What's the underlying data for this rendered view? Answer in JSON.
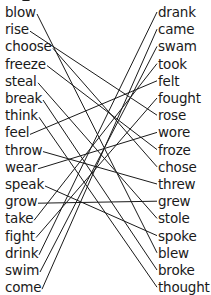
{
  "left_words": [
    "blow",
    "rise",
    "choose",
    "freeze",
    "steal",
    "break",
    "think",
    "feel",
    "throw",
    "wear",
    "speak",
    "grow",
    "take",
    "fight",
    "drink",
    "swim",
    "come"
  ],
  "right_words": [
    "drank",
    "came",
    "swam",
    "took",
    "felt",
    "fought",
    "rose",
    "wore",
    "froze",
    "chose",
    "threw",
    "grew",
    "stole",
    "spoke",
    "blew",
    "broke",
    "thought"
  ],
  "connections": [
    {
      "from": "blow",
      "to": "blew"
    },
    {
      "from": "rise",
      "to": "rose"
    },
    {
      "from": "choose",
      "to": "chose"
    },
    {
      "from": "freeze",
      "to": "froze"
    },
    {
      "from": "steal",
      "to": "stole"
    },
    {
      "from": "break",
      "to": "broke"
    },
    {
      "from": "think",
      "to": "thought"
    },
    {
      "from": "feel",
      "to": "felt"
    },
    {
      "from": "throw",
      "to": "threw"
    },
    {
      "from": "wear",
      "to": "wore"
    },
    {
      "from": "speak",
      "to": "spoke"
    },
    {
      "from": "grow",
      "to": "grew"
    },
    {
      "from": "take",
      "to": "took"
    },
    {
      "from": "fight",
      "to": "fought"
    },
    {
      "from": "drink",
      "to": "drank"
    },
    {
      "from": "swim",
      "to": "swam"
    },
    {
      "from": "come",
      "to": "came"
    }
  ],
  "style": {
    "line_color": "#1a1a1a",
    "text_color": "#1a1a1a",
    "background": "#ffffff"
  }
}
